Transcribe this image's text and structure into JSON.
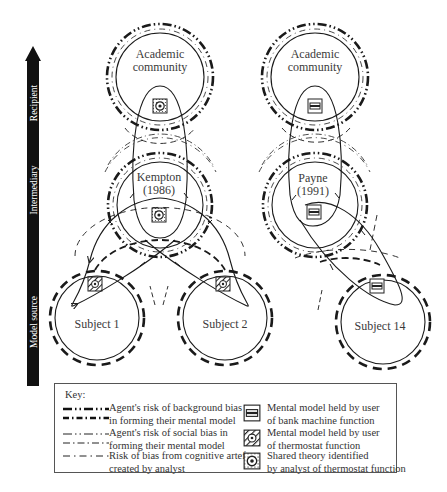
{
  "axis": {
    "labels": [
      "Model source",
      "Intermediary",
      "Recipient"
    ],
    "direction": "up"
  },
  "nodes": {
    "academic_left": {
      "line1": "Academic",
      "line2": "community"
    },
    "academic_right": {
      "line1": "Academic",
      "line2": "community"
    },
    "kempton": {
      "line1": "Kempton",
      "line2": "(1986)"
    },
    "payne": {
      "line1": "Payne",
      "line2": "(1991)"
    },
    "subject1": {
      "label": "Subject 1"
    },
    "subject2": {
      "label": "Subject 2"
    },
    "subject14": {
      "label": "Subject 14"
    }
  },
  "key": {
    "title": "Key:",
    "items": [
      {
        "line1": "Agent's risk of background bias",
        "line2": "in forming their mental model",
        "icon": "background-bias-line"
      },
      {
        "line1": "Agent's risk of social bias in",
        "line2": "forming their mental model",
        "icon": "social-bias-line"
      },
      {
        "line1": "Risk of bias from cognitive artefact",
        "line2": "created by analyst",
        "icon": "artefact-bias-line"
      },
      {
        "line1": "Mental model held by user",
        "line2": "of bank machine function",
        "icon": "bank-machine-icon"
      },
      {
        "line1": "Mental model held by user",
        "line2": "of thermostat function",
        "icon": "thermostat-hatched-icon"
      },
      {
        "line1": "Shared theory identified",
        "line2": "by analyst of thermostat function",
        "icon": "shared-theory-icon"
      }
    ]
  },
  "colors": {
    "ink": "#1a1a1a",
    "text": "#3a3a3a",
    "background": "#ffffff"
  }
}
